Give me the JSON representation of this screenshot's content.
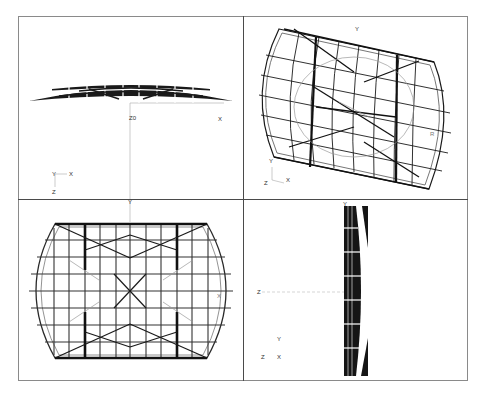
{
  "figure": {
    "viewports": [
      {
        "id": "front",
        "name": "Front elevation (X-Z)",
        "axis_labels": {
          "triad_up": "Y",
          "triad_right": "X",
          "triad_down": "Z",
          "origin": "Z0",
          "x_end": "X"
        }
      },
      {
        "id": "iso",
        "name": "Isometric view",
        "axis_labels": {
          "top": "Y",
          "triad_up": "Y",
          "triad_left": "Z",
          "triad_right": "X",
          "right_marker": "R"
        }
      },
      {
        "id": "plan",
        "name": "Plan view (X-Y)",
        "axis_labels": {
          "top": "Y",
          "right_marker": "X",
          "left_marker": "Y"
        }
      },
      {
        "id": "side",
        "name": "Side elevation (Z-Y)",
        "axis_labels": {
          "top": "Y",
          "left": "Z",
          "triad_up": "Y",
          "triad_left": "Z",
          "triad_right": "X"
        }
      }
    ],
    "colors": {
      "frame": "#8a8a8a",
      "divider": "#4a4a4a",
      "structure": "#1a1a1a",
      "light": "#9a9a9a"
    }
  }
}
